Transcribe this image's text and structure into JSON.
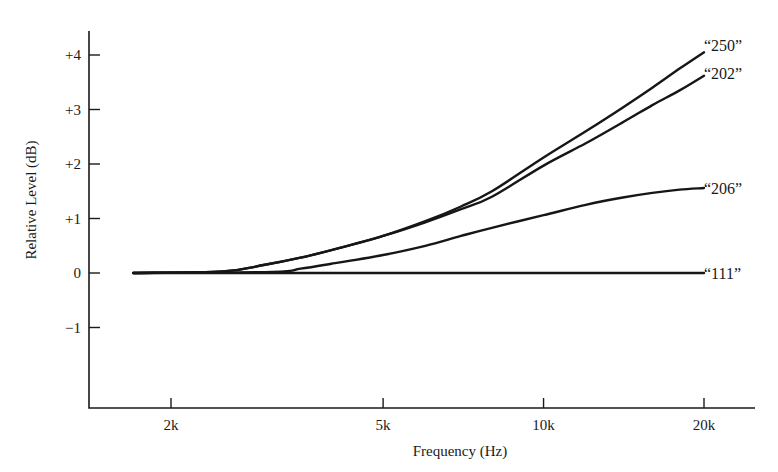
{
  "chart_data": {
    "type": "line",
    "title": "",
    "xlabel": "Frequency (Hz)",
    "ylabel": "Relative Level (dB)",
    "xscale": "log",
    "xlim": [
      1600,
      25500
    ],
    "ylim": [
      -2.5,
      4.45
    ],
    "grid": false,
    "legend": "inline labels at right end of each curve",
    "x_ticks": [
      {
        "value": 2000,
        "label": "2k"
      },
      {
        "value": 5000,
        "label": "5k"
      },
      {
        "value": 10000,
        "label": "10k"
      },
      {
        "value": 20000,
        "label": "20k"
      }
    ],
    "y_ticks": [
      {
        "value": 4,
        "label": "+4"
      },
      {
        "value": 3,
        "label": "+3"
      },
      {
        "value": 2,
        "label": "+2"
      },
      {
        "value": 1,
        "label": "+1"
      },
      {
        "value": 0,
        "label": "0"
      },
      {
        "value": -1,
        "label": "−1"
      }
    ],
    "series": [
      {
        "name": "“250”",
        "x": [
          1700,
          2500,
          3000,
          3500,
          4000,
          5000,
          6000,
          7000,
          8000,
          10000,
          12000,
          14000,
          16000,
          18000,
          20000
        ],
        "y": [
          0,
          0.03,
          0.15,
          0.28,
          0.42,
          0.68,
          0.95,
          1.22,
          1.5,
          2.12,
          2.6,
          3.02,
          3.4,
          3.75,
          4.05
        ]
      },
      {
        "name": "“202”",
        "x": [
          1700,
          2500,
          3000,
          3500,
          4000,
          5000,
          6000,
          7000,
          8000,
          10000,
          12000,
          14000,
          16000,
          18000,
          20000
        ],
        "y": [
          0,
          0.03,
          0.15,
          0.28,
          0.42,
          0.68,
          0.93,
          1.17,
          1.4,
          1.97,
          2.38,
          2.75,
          3.08,
          3.35,
          3.62
        ]
      },
      {
        "name": "“206”",
        "x": [
          1700,
          3100,
          3500,
          4000,
          5000,
          6000,
          7000,
          8000,
          10000,
          12000,
          14000,
          16000,
          18000,
          20000
        ],
        "y": [
          0,
          0.02,
          0.08,
          0.17,
          0.33,
          0.5,
          0.68,
          0.83,
          1.06,
          1.25,
          1.38,
          1.47,
          1.53,
          1.56
        ]
      },
      {
        "name": "“111”",
        "x": [
          1700,
          20000
        ],
        "y": [
          0,
          0
        ]
      }
    ]
  },
  "labels": {
    "xlabel": "Frequency (Hz)",
    "ylabel": "Relative Level (dB)"
  }
}
